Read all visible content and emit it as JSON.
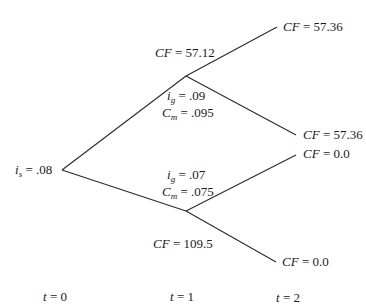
{
  "root": {
    "var": "i",
    "sub": "s",
    "value": ".08"
  },
  "upper_node": {
    "cf": {
      "label": "CF",
      "value": "57.12"
    },
    "ig": {
      "var": "i",
      "sub": "g",
      "value": ".09"
    },
    "cm": {
      "var": "C",
      "sub": "m",
      "value": ".095"
    }
  },
  "lower_node": {
    "cf": {
      "label": "CF",
      "value": "109.5"
    },
    "ig": {
      "var": "i",
      "sub": "g",
      "value": ".07"
    },
    "cm": {
      "var": "C",
      "sub": "m",
      "value": ".075"
    }
  },
  "leaves": [
    {
      "label": "CF",
      "value": "57.36"
    },
    {
      "label": "CF",
      "value": "57.36"
    },
    {
      "label": "CF",
      "value": "0.0"
    },
    {
      "label": "CF",
      "value": "0.0"
    }
  ],
  "time_labels": [
    {
      "var": "t",
      "value": "0"
    },
    {
      "var": "t",
      "value": "1"
    },
    {
      "var": "t",
      "value": "2"
    }
  ],
  "eq": "="
}
